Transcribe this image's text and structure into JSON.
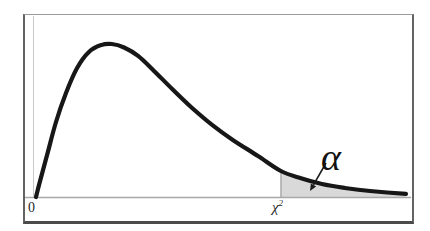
{
  "figure": {
    "origin_label": "0",
    "critical_value": {
      "base": "χ",
      "sup": "2"
    },
    "alpha_label": "α",
    "colors": {
      "curve": "#171717",
      "shade_fill": "#d9d9d9",
      "shade_edge": "#8c8c8c",
      "axis": "#a9a9a9",
      "y_axis": "#c9c9c9",
      "frame": "#636363",
      "arrow": "#1c1c1c",
      "background": "#ffffff"
    }
  },
  "chart_data": {
    "type": "area",
    "title": "",
    "xlabel": "",
    "ylabel": "",
    "grid": false,
    "legend": null,
    "x_tick_labels": [
      "0",
      "χ2"
    ],
    "curve_points": [
      [
        0.0,
        0.0
      ],
      [
        0.011,
        0.105
      ],
      [
        0.03,
        0.275
      ],
      [
        0.054,
        0.49
      ],
      [
        0.081,
        0.68
      ],
      [
        0.111,
        0.843
      ],
      [
        0.143,
        0.948
      ],
      [
        0.176,
        0.993
      ],
      [
        0.205,
        1.0
      ],
      [
        0.238,
        0.977
      ],
      [
        0.276,
        0.922
      ],
      [
        0.319,
        0.824
      ],
      [
        0.368,
        0.706
      ],
      [
        0.422,
        0.582
      ],
      [
        0.476,
        0.471
      ],
      [
        0.532,
        0.373
      ],
      [
        0.6,
        0.268
      ],
      [
        0.662,
        0.17
      ],
      [
        0.714,
        0.124
      ],
      [
        0.773,
        0.085
      ],
      [
        0.835,
        0.059
      ],
      [
        0.903,
        0.039
      ],
      [
        1.0,
        0.02
      ]
    ],
    "critical_x": 0.662,
    "shaded_region": {
      "from": "critical_x",
      "to": 1.0,
      "area_label": "α"
    },
    "annotations": [
      {
        "text": "α",
        "target": "shaded-tail-region",
        "arrow": true
      }
    ]
  }
}
